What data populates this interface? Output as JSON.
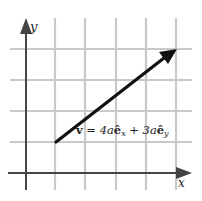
{
  "diagram": {
    "type": "vector-on-grid",
    "axes": {
      "x_label": "x",
      "y_label": "y"
    },
    "grid": {
      "columns": 6,
      "rows": 5,
      "color": "#c8c8c8"
    },
    "vector": {
      "name": "v",
      "from": [
        1,
        1
      ],
      "to": [
        5,
        4
      ],
      "components": {
        "x": "4a",
        "y": "3a"
      },
      "color": "#000000"
    },
    "label": {
      "v": "v",
      "eq": " = 4a",
      "ex": "ê",
      "ex_sub": "x",
      "plus": " + 3a",
      "ey": "ê",
      "ey_sub": "y"
    }
  }
}
